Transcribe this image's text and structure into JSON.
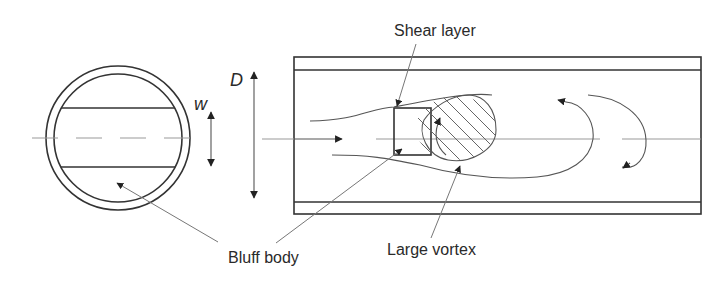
{
  "diagram": {
    "symbols": {
      "width": "w",
      "diameter": "D"
    },
    "labels": {
      "shear_layer": "Shear layer",
      "bluff_body": "Bluff body",
      "large_vortex": "Large vortex"
    },
    "views": [
      "cross-section end view",
      "longitudinal section"
    ],
    "colors": {
      "line": "#333333",
      "leader": "#777777",
      "centerline": "#999999",
      "background": "#ffffff"
    }
  }
}
